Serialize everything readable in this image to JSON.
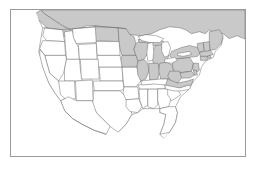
{
  "figure": {
    "title": "Map of the contiguous United States",
    "frame_color": "#9a9a9a",
    "background_color": "#ffffff"
  },
  "legend": {
    "shaded_label": "Shaded region",
    "shaded_color": "#c9c9c9",
    "plain_label": "Unshaded region",
    "plain_color": "#ffffff",
    "boundary_color": "#5a5a5a"
  },
  "map_data": {
    "type": "choropleth",
    "projection": "albers-usa-approximate",
    "shaded_regions": [
      "Canada",
      "Washington-north-edge",
      "Montana-north-edge",
      "North Dakota",
      "Minnesota",
      "Wisconsin",
      "Michigan",
      "Iowa",
      "Illinois",
      "Indiana",
      "Ohio",
      "Pennsylvania",
      "New York",
      "Vermont",
      "New Hampshire",
      "Maine",
      "Massachusetts",
      "Rhode Island",
      "Connecticut",
      "New Jersey",
      "Delaware",
      "Maryland",
      "West Virginia",
      "Virginia"
    ],
    "unshaded_regions": [
      "California",
      "Oregon",
      "Washington",
      "Nevada",
      "Idaho",
      "Montana",
      "Wyoming",
      "Utah",
      "Arizona",
      "Colorado",
      "New Mexico",
      "South Dakota",
      "Nebraska",
      "Kansas",
      "Oklahoma",
      "Texas",
      "Missouri",
      "Arkansas",
      "Louisiana",
      "Mississippi",
      "Alabama",
      "Tennessee",
      "Kentucky",
      "Georgia",
      "Florida",
      "South Carolina",
      "North Carolina",
      "Mexico"
    ],
    "water_features": [
      "Lake Superior",
      "Lake Michigan",
      "Lake Huron",
      "Lake Erie",
      "Lake Ontario",
      "Atlantic Ocean",
      "Pacific Ocean",
      "Gulf of Mexico"
    ]
  }
}
